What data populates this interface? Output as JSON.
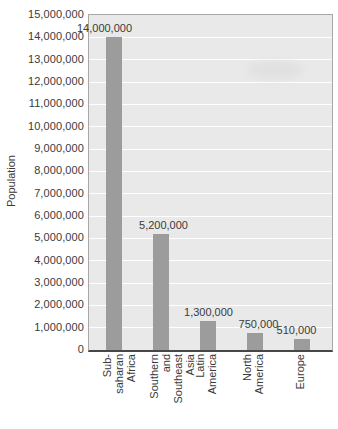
{
  "chart_data": {
    "type": "bar",
    "title": "",
    "xlabel": "",
    "ylabel": "Population",
    "categories": [
      "Sub-saharan Africa",
      "Southern and Southeast Asia",
      "Latin America",
      "North America",
      "Europe"
    ],
    "category_label_lines": [
      [
        "Sub-saharan",
        "Africa"
      ],
      [
        "Southern and",
        "Southeast Asia"
      ],
      [
        "Latin",
        "America"
      ],
      [
        "North",
        "America"
      ],
      [
        "Europe"
      ]
    ],
    "values": [
      14000000,
      5200000,
      1300000,
      750000,
      510000
    ],
    "bar_value_labels": [
      "14,000,000",
      "5,200,000",
      "1,300,000",
      "750,000",
      "510,000"
    ],
    "ylim": [
      0,
      15000000
    ],
    "ytick_step": 1000000,
    "ytick_labels_top_to_bottom": [
      "15,000,000",
      "14,000,000",
      "13,000,000",
      "12,000,000",
      "11,000,000",
      "10,000,000",
      "9,000,000",
      "8,000,000",
      "7,000,000",
      "6,000,000",
      "5,000,000",
      "4,000,000",
      "3,000,000",
      "2,000,000",
      "1,000,000",
      "0"
    ],
    "grid": true,
    "legend": "none",
    "colors": {
      "bar": "#9c9c9c",
      "plot_background": "#e9e9e9",
      "gridline": "#ffffff",
      "plot_border": "#a8a8a8",
      "axis_line": "#474747",
      "text": "#3a3a3a"
    }
  }
}
